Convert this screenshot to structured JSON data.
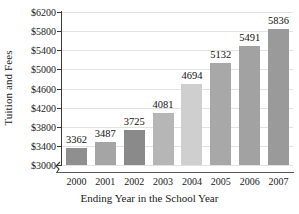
{
  "chart_data": {
    "type": "bar",
    "title": "",
    "xlabel": "Ending Year in the School Year",
    "ylabel": "Tuition and Fees",
    "categories": [
      "2000",
      "2001",
      "2002",
      "2003",
      "2004",
      "2005",
      "2006",
      "2007"
    ],
    "values": [
      3362,
      3487,
      3725,
      4081,
      4694,
      5132,
      5491,
      5836
    ],
    "value_labels": [
      "3362",
      "3487",
      "3725",
      "4081",
      "4694",
      "5132",
      "5491",
      "5836"
    ],
    "ylim": [
      3000,
      6200
    ],
    "ytick_values": [
      3000,
      3400,
      3800,
      4200,
      4600,
      5000,
      5400,
      5800,
      6200
    ],
    "ytick_labels": [
      "$3000",
      "$3400",
      "$3800",
      "$4200",
      "$4600",
      "$5000",
      "$5400",
      "$5800",
      "$6200"
    ],
    "grid": true,
    "legend": false,
    "axis_break": true,
    "bar_colors": [
      "#8f8f8f",
      "#a5a5a5",
      "#8a8a8a",
      "#b6b6b6",
      "#cfcfcf",
      "#a8a8a8",
      "#a2a2a2",
      "#9a9a9a"
    ],
    "gridline_color": "#e2e2e2",
    "axis_color": "#3a3a3a",
    "background": "#ffffff"
  }
}
